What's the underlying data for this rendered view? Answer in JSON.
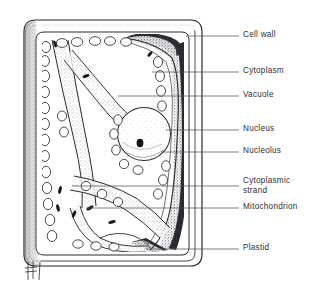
{
  "figure": {
    "type": "biological-diagram",
    "style": "pen-and-ink stipple line drawing",
    "background_color": "#ffffff",
    "ink_color": "#2e2e33",
    "leader_line_color": "#55555c",
    "signature_mark": "artist initials"
  },
  "labels": [
    {
      "id": "cell-wall",
      "text": "Cell wall",
      "x": 243,
      "y": 30,
      "leader": {
        "x1": 186,
        "y1": 36,
        "x2": 239,
        "y2": 36
      }
    },
    {
      "id": "cytoplasm",
      "text": "Cytoplasm",
      "x": 243,
      "y": 66,
      "leader": {
        "x1": 152,
        "y1": 72,
        "x2": 239,
        "y2": 72
      }
    },
    {
      "id": "vacuole",
      "text": "Vacuole",
      "x": 243,
      "y": 90,
      "leader": {
        "x1": 118,
        "y1": 96,
        "x2": 239,
        "y2": 96
      }
    },
    {
      "id": "nucleus",
      "text": "Nucleus",
      "x": 243,
      "y": 124,
      "leader": {
        "x1": 166,
        "y1": 130,
        "x2": 239,
        "y2": 130
      }
    },
    {
      "id": "nucleolus",
      "text": "Nucleolus",
      "x": 243,
      "y": 146,
      "leader": {
        "x1": 161,
        "y1": 152,
        "x2": 239,
        "y2": 152
      }
    },
    {
      "id": "cytoplasmic-strand",
      "text": "Cytoplasmic\nstrand",
      "x": 243,
      "y": 176,
      "leader": {
        "x1": 72,
        "y1": 186,
        "x2": 239,
        "y2": 186
      }
    },
    {
      "id": "mitochondrion",
      "text": "Mitochondrion",
      "x": 243,
      "y": 202,
      "leader": {
        "x1": 86,
        "y1": 208,
        "x2": 239,
        "y2": 208
      }
    },
    {
      "id": "plastid",
      "text": "Plastid",
      "x": 243,
      "y": 243,
      "leader": {
        "x1": 146,
        "y1": 249,
        "x2": 239,
        "y2": 249
      }
    }
  ],
  "structures": {
    "cell_wall": {
      "name": "Cell wall",
      "shape": "rounded-rectangle",
      "layers": 3
    },
    "cytoplasm": {
      "name": "Cytoplasm",
      "shape": "dark peripheral band"
    },
    "vacuole": {
      "name": "Vacuole",
      "shape": "large pale central region"
    },
    "nucleus": {
      "name": "Nucleus",
      "shape": "stippled circle",
      "cx": 144,
      "cy": 134,
      "r": 26
    },
    "nucleolus": {
      "name": "Nucleolus",
      "shape": "small dark ellipse",
      "cx": 140,
      "cy": 143,
      "rx": 3.4,
      "ry": 4.2
    },
    "cytoplasmic_strands": {
      "name": "Cytoplasmic strand",
      "count": 4
    },
    "mitochondria": {
      "name": "Mitochondrion",
      "shape": "dark sliver",
      "count": 9
    },
    "plastids": {
      "name": "Plastid",
      "shape": "oval outline",
      "count": 34
    }
  }
}
